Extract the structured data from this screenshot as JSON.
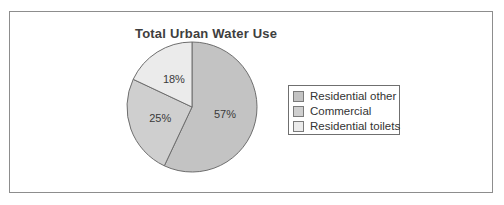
{
  "chart_data": {
    "type": "pie",
    "title": "Total Urban Water Use",
    "slices": [
      {
        "label": "Residential other",
        "value": 57,
        "display": "57%",
        "color": "#c3c3c3"
      },
      {
        "label": "Commercial",
        "value": 25,
        "display": "25%",
        "color": "#cfcfcf"
      },
      {
        "label": "Residential toilets",
        "value": 18,
        "display": "18%",
        "color": "#ebebeb"
      }
    ],
    "start_angle_deg": 0,
    "direction": "clockwise",
    "legend_position": "right",
    "slice_label_color": "#3a3a3a",
    "pie_outline_color": "#6e6e6e",
    "frame_border_color": "#8d8d8d",
    "legend_border_color": "#6f6f6f",
    "title_color": "#3e3e3e"
  }
}
